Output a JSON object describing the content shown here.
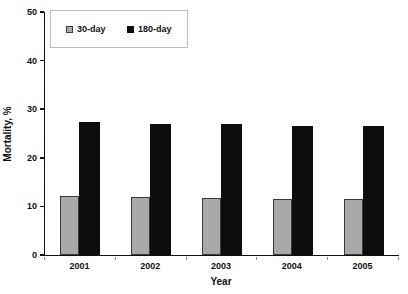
{
  "chart_data": {
    "type": "bar",
    "title": "",
    "xlabel": "Year",
    "ylabel": "Mortality, %",
    "categories": [
      "2001",
      "2002",
      "2003",
      "2004",
      "2005"
    ],
    "series": [
      {
        "name": "30-day",
        "color": "#a9a9a9",
        "border_color": "#3a3a3a",
        "values": [
          12.2,
          12.0,
          11.8,
          11.5,
          11.5
        ]
      },
      {
        "name": "180-day",
        "color": "#0d0d0d",
        "border_color": "#0d0d0d",
        "values": [
          27.4,
          27.0,
          26.9,
          26.6,
          26.5
        ]
      }
    ],
    "ylim": [
      0,
      50
    ],
    "yticks": [
      0,
      10,
      20,
      30,
      40,
      50
    ],
    "grid": false,
    "legend_position": "top-left-inside",
    "background": "#ffffff",
    "text_color": "#111111"
  }
}
